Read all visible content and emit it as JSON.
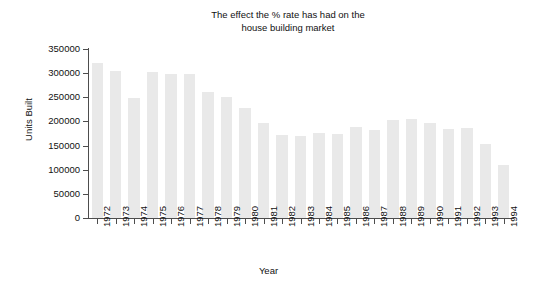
{
  "chart_data": {
    "type": "bar",
    "title": "The effect the % rate has had on the\nhouse building market",
    "xlabel": "Year",
    "ylabel": "Units Built",
    "grid": false,
    "legend": null,
    "ylim": [
      0,
      350000
    ],
    "ytick_labels": [
      "350000",
      "300000",
      "250000",
      "200000",
      "150000",
      "100000",
      "50000",
      "0"
    ],
    "ytick_values": [
      350000,
      300000,
      250000,
      200000,
      150000,
      100000,
      50000,
      0
    ],
    "categories": [
      "1972",
      "1973",
      "1974",
      "1975",
      "1976",
      "1977",
      "1978",
      "1979",
      "1980",
      "1981",
      "1982",
      "1983",
      "1984",
      "1985",
      "1986",
      "1987",
      "1988",
      "1989",
      "1990",
      "1991",
      "1992",
      "1993",
      "1994"
    ],
    "values": [
      322000,
      305000,
      248000,
      302000,
      299000,
      298000,
      262000,
      251000,
      228000,
      196000,
      172000,
      170000,
      176000,
      173000,
      188000,
      182000,
      203000,
      205000,
      196000,
      185000,
      186000,
      153000,
      110000
    ],
    "bar_color": "#e9e9e9",
    "axis_color": "#4d4d4d",
    "background_color": "#ffffff"
  }
}
